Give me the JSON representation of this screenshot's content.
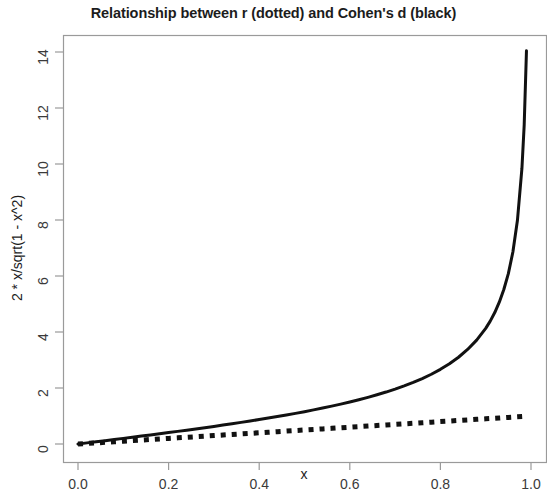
{
  "chart_data": {
    "type": "line",
    "title": "Relationship between r (dotted) and Cohen's d (black)",
    "xlabel": "x",
    "ylabel": "2 * x/sqrt(1 - x^2)",
    "xlim": [
      0.0,
      1.0
    ],
    "ylim": [
      0.0,
      14.2
    ],
    "grid": false,
    "legend": "none (described in title)",
    "xticks": [
      "0.0",
      "0.2",
      "0.4",
      "0.6",
      "0.8",
      "1.0"
    ],
    "xtick_values": [
      0.0,
      0.2,
      0.4,
      0.6,
      0.8,
      1.0
    ],
    "yticks": [
      "0",
      "2",
      "4",
      "6",
      "8",
      "10",
      "12",
      "14"
    ],
    "ytick_values": [
      0,
      2,
      4,
      6,
      8,
      10,
      12,
      14
    ],
    "x": [
      0.0,
      0.02,
      0.04,
      0.06,
      0.08,
      0.1,
      0.12,
      0.14,
      0.16,
      0.18,
      0.2,
      0.22,
      0.24,
      0.26,
      0.28,
      0.3,
      0.32,
      0.34,
      0.36,
      0.38,
      0.4,
      0.42,
      0.44,
      0.46,
      0.48,
      0.5,
      0.52,
      0.54,
      0.56,
      0.58,
      0.6,
      0.62,
      0.64,
      0.66,
      0.68,
      0.7,
      0.72,
      0.74,
      0.76,
      0.78,
      0.8,
      0.82,
      0.84,
      0.86,
      0.88,
      0.9,
      0.91,
      0.92,
      0.93,
      0.94,
      0.95,
      0.96,
      0.97,
      0.98,
      0.985,
      0.99
    ],
    "series": [
      {
        "name": "Cohen's d",
        "style": "solid",
        "color": "#111111",
        "width": 3.0,
        "formula": "2 * x / sqrt(1 - x^2)",
        "values": [
          0.0,
          0.04,
          0.08,
          0.12,
          0.161,
          0.201,
          0.242,
          0.283,
          0.324,
          0.366,
          0.408,
          0.451,
          0.494,
          0.539,
          0.583,
          0.629,
          0.676,
          0.723,
          0.772,
          0.822,
          0.873,
          0.926,
          0.98,
          1.036,
          1.094,
          1.155,
          1.218,
          1.283,
          1.352,
          1.424,
          1.5,
          1.58,
          1.666,
          1.757,
          1.855,
          1.961,
          2.076,
          2.201,
          2.338,
          2.491,
          2.667,
          2.866,
          3.098,
          3.376,
          3.71,
          4.13,
          4.387,
          4.695,
          5.064,
          5.517,
          6.084,
          6.857,
          7.981,
          9.849,
          11.398,
          14.043
        ]
      },
      {
        "name": "r",
        "style": "dotted",
        "color": "#111111",
        "width": 5.0,
        "formula": "x",
        "values": [
          0.0,
          0.02,
          0.04,
          0.06,
          0.08,
          0.1,
          0.12,
          0.14,
          0.16,
          0.18,
          0.2,
          0.22,
          0.24,
          0.26,
          0.28,
          0.3,
          0.32,
          0.34,
          0.36,
          0.38,
          0.4,
          0.42,
          0.44,
          0.46,
          0.48,
          0.5,
          0.52,
          0.54,
          0.56,
          0.58,
          0.6,
          0.62,
          0.64,
          0.66,
          0.68,
          0.7,
          0.72,
          0.74,
          0.76,
          0.78,
          0.8,
          0.82,
          0.84,
          0.86,
          0.88,
          0.9,
          0.91,
          0.92,
          0.93,
          0.94,
          0.95,
          0.96,
          0.97,
          0.98,
          0.985,
          0.99
        ]
      }
    ]
  },
  "plot": {
    "box_color": "#9a9a9a",
    "tick_color": "#9a9a9a",
    "background": "#ffffff"
  }
}
